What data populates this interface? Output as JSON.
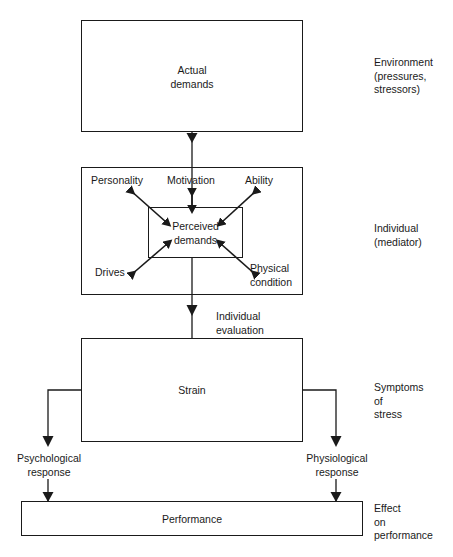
{
  "diagram": {
    "title_text": "Stress model flow diagram",
    "boxes": {
      "actual_demands": "Actual\ndemands",
      "perceived_demands": "Perceived\ndemands",
      "strain": "Strain",
      "performance": "Performance"
    },
    "mediator_factors": {
      "personality": "Personality",
      "motivation": "Motivation",
      "ability": "Ability",
      "drives": "Drives",
      "physical_condition": "Physical\ncondition"
    },
    "flow_labels": {
      "individual_evaluation": "Individual\nevaluation",
      "psychological_response": "Psychological\nresponse",
      "physiological_response": "Physiological\nresponse"
    },
    "side_labels": {
      "environment": "Environment\n(pressures,\nstressors)",
      "individual": "Individual\n(mediator)",
      "symptoms": "Symptoms\nof\nstress",
      "effect": "Effect\non\nperformance"
    },
    "colors": {
      "stroke": "#1a1a1a",
      "background": "#ffffff",
      "text": "#1a1a1a"
    }
  }
}
